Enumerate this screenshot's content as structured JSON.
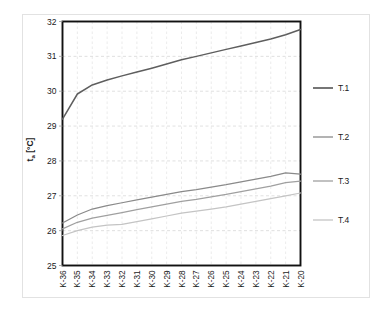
{
  "chart_data": {
    "type": "line",
    "title": "",
    "xlabel": "",
    "ylabel": "tₐ [°C]",
    "ylabel_base": "t",
    "ylabel_sub": "a",
    "ylabel_unit": "[°C]",
    "categories": [
      "K-36",
      "K-35",
      "K-34",
      "K-33",
      "K-32",
      "K-31",
      "K-30",
      "K-29",
      "K-28",
      "K-27",
      "K-26",
      "K-25",
      "K-24",
      "K-23",
      "K-22",
      "K-21",
      "K-20"
    ],
    "ylim": [
      25,
      32
    ],
    "yticks": [
      25,
      26,
      27,
      28,
      29,
      30,
      31,
      32
    ],
    "ytick_labels": [
      "25",
      "26",
      "27",
      "28",
      "29",
      "30",
      "31",
      "32"
    ],
    "grid": true,
    "grid_style": "dashed",
    "legend_position": "right",
    "series": [
      {
        "name": "T.1",
        "color": "#5e5e5e",
        "values": [
          29.2,
          29.92,
          30.18,
          30.32,
          30.44,
          30.55,
          30.66,
          30.78,
          30.9,
          31.0,
          31.1,
          31.2,
          31.3,
          31.4,
          31.5,
          31.62,
          31.77
        ]
      },
      {
        "name": "T.2",
        "color": "#8a8a8a",
        "values": [
          26.22,
          26.45,
          26.62,
          26.72,
          26.8,
          26.88,
          26.96,
          27.04,
          27.12,
          27.18,
          27.25,
          27.32,
          27.4,
          27.48,
          27.56,
          27.66,
          27.62
        ]
      },
      {
        "name": "T.3",
        "color": "#a0a0a0",
        "values": [
          26.05,
          26.24,
          26.36,
          26.44,
          26.52,
          26.6,
          26.68,
          26.76,
          26.84,
          26.9,
          26.97,
          27.04,
          27.12,
          27.2,
          27.28,
          27.38,
          27.42
        ]
      },
      {
        "name": "T.4",
        "color": "#c4c4c4",
        "values": [
          25.86,
          26.0,
          26.1,
          26.16,
          26.18,
          26.26,
          26.34,
          26.42,
          26.5,
          26.56,
          26.62,
          26.68,
          26.76,
          26.84,
          26.92,
          27.0,
          27.08
        ]
      }
    ]
  },
  "legend": {
    "items": [
      {
        "label": "T.1"
      },
      {
        "label": "T.2"
      },
      {
        "label": "T.3"
      },
      {
        "label": "T.4"
      }
    ]
  }
}
